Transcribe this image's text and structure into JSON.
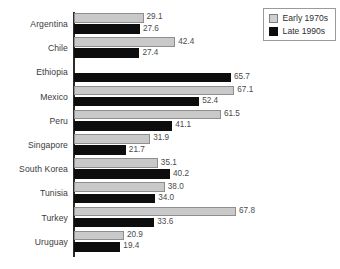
{
  "chart_data": {
    "type": "bar",
    "orientation": "horizontal",
    "title": "",
    "xlabel": "",
    "ylabel": "",
    "xlim": [
      0,
      67.8
    ],
    "grid": false,
    "legend_position": "top-right",
    "categories": [
      "Argentina",
      "Chile",
      "Ethiopia",
      "Mexico",
      "Peru",
      "Singapore",
      "South Korea",
      "Tunisia",
      "Turkey",
      "Uruguay"
    ],
    "series": [
      {
        "name": "Early 1970s",
        "color": "#c9c9c9",
        "values": [
          29.1,
          42.4,
          null,
          67.1,
          61.5,
          31.9,
          35.1,
          38.0,
          67.8,
          20.9
        ],
        "labels": [
          "29.1",
          "42.4",
          "",
          "67.1",
          "61.5",
          "31.9",
          "35.1",
          "38.0",
          "67.8",
          "20.9"
        ]
      },
      {
        "name": "Late 1990s",
        "color": "#0d0d0d",
        "values": [
          27.6,
          27.4,
          65.7,
          52.4,
          41.1,
          21.7,
          40.2,
          34.0,
          33.6,
          19.4
        ],
        "labels": [
          "27.6",
          "27.4",
          "65.7",
          "52.4",
          "41.1",
          "21.7",
          "40.2",
          "34.0",
          "33.6",
          "19.4"
        ]
      }
    ]
  },
  "legend": {
    "items": [
      {
        "label": "Early 1970s",
        "swatch": "early"
      },
      {
        "label": "Late 1990s",
        "swatch": "late"
      }
    ]
  }
}
